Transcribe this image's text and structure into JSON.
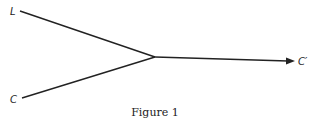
{
  "diagram": {
    "type": "flow",
    "nodes": [
      {
        "id": "L",
        "label": "L"
      },
      {
        "id": "C",
        "label": "C"
      },
      {
        "id": "Cprime",
        "label": "C′"
      }
    ],
    "edges": [
      {
        "from": "L",
        "to": "junction"
      },
      {
        "from": "C",
        "to": "junction"
      },
      {
        "from": "junction",
        "to": "Cprime",
        "arrow": true
      }
    ],
    "caption": "Figure 1"
  },
  "colors": {
    "line": "#222222",
    "background": "#ffffff"
  }
}
